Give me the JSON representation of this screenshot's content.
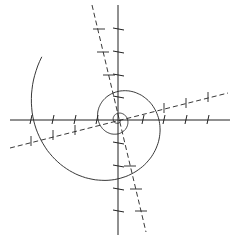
{
  "diagram": {
    "title": "",
    "type": "logarithmic-spiral-with-axes",
    "colors": {
      "background": "#ffffff",
      "stroke": "#222222"
    },
    "center": [
      118,
      120
    ],
    "axes": {
      "horizontal": {
        "from": [
          10,
          120
        ],
        "to": [
          230,
          120
        ]
      },
      "vertical": {
        "from": [
          118,
          5
        ],
        "to": [
          118,
          235
        ]
      }
    },
    "dashed_lines": [
      {
        "name": "rotated-axis-steep",
        "from": [
          92,
          5
        ],
        "to": [
          146,
          232
        ]
      },
      {
        "name": "rotated-axis-shallow",
        "from": [
          10,
          148
        ],
        "to": [
          228,
          93
        ]
      }
    ],
    "horizontal_axis_ticks_x": [
      31,
      53,
      75,
      97,
      143,
      164,
      186,
      208
    ],
    "vertical_axis_ticks_y": [
      29,
      52,
      75,
      97,
      143,
      166,
      189,
      211
    ],
    "steep_dashed_ticks": [
      [
        99,
        29
      ],
      [
        103,
        52
      ],
      [
        109,
        75
      ],
      [
        130,
        166
      ],
      [
        136,
        189
      ],
      [
        141,
        211
      ]
    ],
    "shallow_dashed_ticks": [
      [
        31,
        141
      ],
      [
        53,
        135
      ],
      [
        75,
        130
      ],
      [
        164,
        108
      ],
      [
        186,
        103
      ],
      [
        208,
        97
      ]
    ],
    "labels": []
  }
}
